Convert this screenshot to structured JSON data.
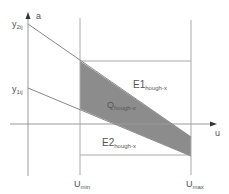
{
  "diagram": {
    "axis_vertical_label": "a",
    "axis_horizontal_label": "u",
    "y_labels": [
      {
        "main": "y",
        "sub": "2ij"
      },
      {
        "main": "y",
        "sub": "1ij"
      }
    ],
    "u_min": {
      "main": "U",
      "sub": "min"
    },
    "u_max": {
      "main": "U",
      "sub": "max"
    },
    "region_E1": {
      "main": "E1",
      "sub": "hough-x"
    },
    "region_Q": {
      "main": "Q",
      "sub": "hough-x"
    },
    "region_E2": {
      "main": "E2",
      "sub": "hough-x"
    },
    "colors": {
      "line": "#9a9a9a",
      "fill": "#8c8c8c",
      "axis": "#444444"
    }
  }
}
